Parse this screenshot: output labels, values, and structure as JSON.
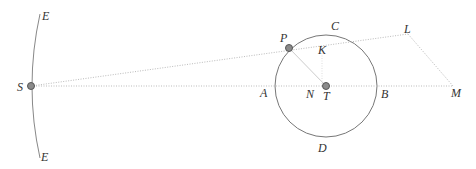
{
  "diagram": {
    "labels": {
      "E_top": "E",
      "E_bottom": "E",
      "S": "S",
      "P": "P",
      "C": "C",
      "K": "K",
      "L": "L",
      "A": "A",
      "N": "N",
      "T": "T",
      "B": "B",
      "M": "M",
      "D": "D"
    },
    "colors": {
      "line": "#888888",
      "dotted": "#bbbbbb",
      "point_fill": "#8a8a8a",
      "point_stroke": "#555555"
    }
  }
}
